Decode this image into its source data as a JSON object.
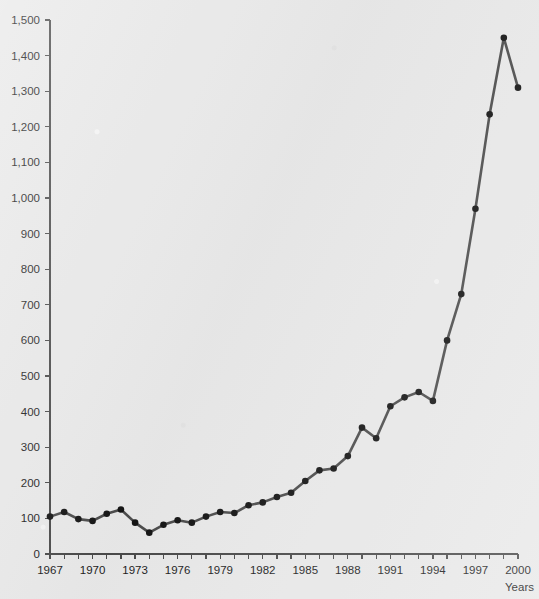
{
  "chart_data": {
    "type": "line",
    "title": "",
    "subtitle": "",
    "xlabel": "Years",
    "ylabel": "",
    "xlim": [
      1967,
      2000
    ],
    "ylim": [
      0,
      1500
    ],
    "grid": false,
    "legend": null,
    "x": [
      1967,
      1968,
      1969,
      1970,
      1971,
      1972,
      1973,
      1974,
      1975,
      1976,
      1977,
      1978,
      1979,
      1980,
      1981,
      1982,
      1983,
      1984,
      1985,
      1986,
      1987,
      1988,
      1989,
      1990,
      1991,
      1992,
      1993,
      1994,
      1995,
      1996,
      1997,
      1998,
      1999,
      2000
    ],
    "series": [
      {
        "name": "",
        "values": [
          105,
          118,
          98,
          93,
          113,
          125,
          88,
          60,
          82,
          95,
          88,
          105,
          118,
          115,
          137,
          145,
          160,
          172,
          205,
          235,
          240,
          275,
          355,
          325,
          415,
          440,
          455,
          430,
          600,
          730,
          970,
          1235,
          1450,
          1310
        ]
      }
    ],
    "x_tick_labels": [
      "1967",
      "1970",
      "1973",
      "1976",
      "1979",
      "1982",
      "1985",
      "1988",
      "1991",
      "1994",
      "1997",
      "2000"
    ],
    "x_tick_values": [
      1967,
      1970,
      1973,
      1976,
      1979,
      1982,
      1985,
      1988,
      1991,
      1994,
      1997,
      2000
    ],
    "y_tick_labels": [
      "0",
      "100",
      "200",
      "300",
      "400",
      "500",
      "600",
      "700",
      "800",
      "900",
      "1,000",
      "1,100",
      "1,200",
      "1,300",
      "1,400",
      "1,500"
    ],
    "y_tick_values": [
      0,
      100,
      200,
      300,
      400,
      500,
      600,
      700,
      800,
      900,
      1000,
      1100,
      1200,
      1300,
      1400,
      1500
    ],
    "colors": {
      "background": "#e9e9e9",
      "line": "#4d4d4d",
      "marker": "#151515",
      "axis": "#4a4a4a",
      "text": "#1c1c1c"
    }
  }
}
